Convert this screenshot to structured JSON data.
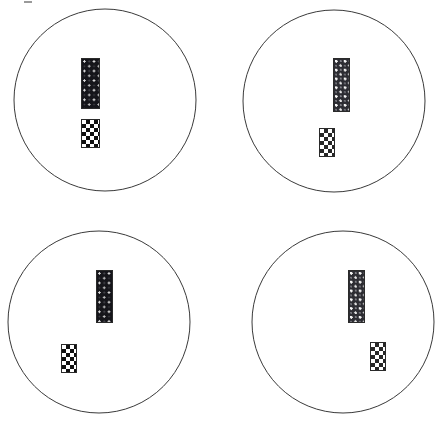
{
  "canvas": {
    "width": 446,
    "height": 424,
    "background": "#ffffff"
  },
  "style": {
    "circle_stroke": "#3a3a3a",
    "circle_stroke_width": 1,
    "circle_fill": "#ffffff",
    "bar_border": "#2a2a2a",
    "tall_bar_fill": "#15151a",
    "tall_bar_fill_light": "#2c2c32",
    "check_dark": "#101010",
    "check_light": "#ffffff"
  },
  "panels": [
    {
      "id": "panel-top-left",
      "label": "Panel 1",
      "origin": {
        "x": 0,
        "y": 0
      },
      "circle": {
        "cx": 105,
        "cy": 100,
        "r": 91
      },
      "texture": "dark",
      "shapes": [
        {
          "name": "tall-bar",
          "kind": "dotted-bar",
          "x": 81,
          "y": 58,
          "width": 19,
          "height": 51
        },
        {
          "name": "checker-bar",
          "kind": "checkerboard-bar",
          "x": 81,
          "y": 119,
          "width": 19,
          "height": 29
        }
      ]
    },
    {
      "id": "panel-top-right",
      "label": "Panel 2",
      "origin": {
        "x": 223,
        "y": 0
      },
      "circle": {
        "cx": 111,
        "cy": 101,
        "r": 91
      },
      "texture": "grainy",
      "shapes": [
        {
          "name": "tall-bar",
          "kind": "dotted-bar",
          "x": 110,
          "y": 58,
          "width": 17,
          "height": 54
        },
        {
          "name": "checker-bar",
          "kind": "checkerboard-bar",
          "x": 96,
          "y": 128,
          "width": 16,
          "height": 29
        }
      ]
    },
    {
      "id": "panel-bottom-left",
      "label": "Panel 3",
      "origin": {
        "x": 0,
        "y": 212
      },
      "circle": {
        "cx": 99,
        "cy": 110,
        "r": 91
      },
      "texture": "dark",
      "shapes": [
        {
          "name": "tall-bar",
          "kind": "dotted-bar",
          "x": 96,
          "y": 58,
          "width": 17,
          "height": 53
        },
        {
          "name": "checker-bar",
          "kind": "checkerboard-bar",
          "x": 61,
          "y": 132,
          "width": 16,
          "height": 29
        }
      ]
    },
    {
      "id": "panel-bottom-right",
      "label": "Panel 4",
      "origin": {
        "x": 223,
        "y": 212
      },
      "circle": {
        "cx": 120,
        "cy": 110,
        "r": 91
      },
      "texture": "grainy",
      "shapes": [
        {
          "name": "tall-bar",
          "kind": "dotted-bar",
          "x": 125,
          "y": 58,
          "width": 17,
          "height": 53
        },
        {
          "name": "checker-bar",
          "kind": "checkerboard-bar",
          "x": 147,
          "y": 130,
          "width": 16,
          "height": 29
        }
      ]
    }
  ],
  "marks": [
    {
      "name": "top-tick",
      "x": 24,
      "y": 1,
      "width": 8,
      "height": 2
    }
  ]
}
